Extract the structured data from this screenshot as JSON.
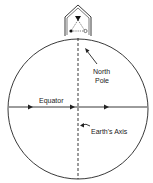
{
  "diagram": {
    "labels": {
      "north_pole_line1": "North",
      "north_pole_line2": "Pole",
      "equator": "Equator",
      "earths_axis": "Earth's Axis"
    },
    "colors": {
      "stroke": "#222222",
      "background": "#ffffff"
    }
  }
}
